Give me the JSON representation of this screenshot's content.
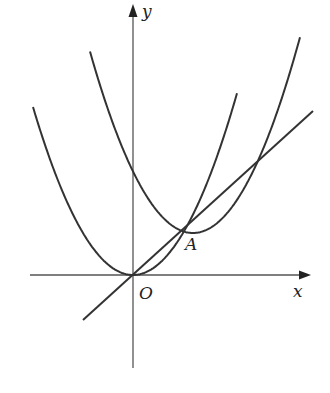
{
  "diagram": {
    "type": "coordinate-graph",
    "axes": {
      "x_label": "x",
      "y_label": "y",
      "origin_label": "O"
    },
    "points": [
      {
        "label": "A",
        "description": "tangent point of line with both parabolas"
      }
    ],
    "curves": [
      {
        "name": "parabola-1",
        "description": "upward parabola with vertex at O"
      },
      {
        "name": "parabola-2",
        "description": "upward parabola with vertex near A, y-intercept above O"
      },
      {
        "name": "line",
        "description": "straight line through O and A"
      }
    ],
    "colors": {
      "stroke": "#333333",
      "axis": "#555555",
      "background": "#ffffff"
    }
  }
}
